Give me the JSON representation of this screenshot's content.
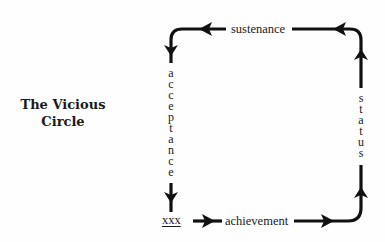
{
  "title": {
    "line1": "The Vicious",
    "line2": "Circle"
  },
  "cycle": {
    "nodes": [
      {
        "id": "xxx",
        "label": "xxx",
        "position": "bottom-left",
        "underlined": true
      },
      {
        "id": "achievement",
        "label": "achievement",
        "side": "bottom",
        "direction": "right"
      },
      {
        "id": "status",
        "label": "status",
        "side": "right",
        "direction": "up",
        "orientation": "vertical-stacked"
      },
      {
        "id": "sustenance",
        "label": "sustenance",
        "side": "top",
        "direction": "left"
      },
      {
        "id": "acceptance",
        "label": "acceptance",
        "side": "left",
        "direction": "down",
        "orientation": "vertical-stacked"
      }
    ],
    "flow": [
      "xxx",
      "achievement",
      "status",
      "sustenance",
      "acceptance",
      "xxx"
    ]
  },
  "labels": {
    "sustenance": "sustenance",
    "achievement": "achievement",
    "xxx": "xxx",
    "acceptance_letters": [
      "a",
      "c",
      "c",
      "e",
      "p",
      "t",
      "a",
      "n",
      "c",
      "e"
    ],
    "status_letters": [
      "s",
      "t",
      "a",
      "t",
      "u",
      "s"
    ]
  },
  "colors": {
    "stroke": "#111111",
    "text": "#1a1a1a",
    "background": "#fefefe"
  }
}
